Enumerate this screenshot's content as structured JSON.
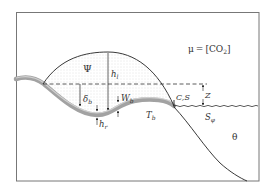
{
  "diagram": {
    "type": "ice-sheet / subglacial lake cross-section schematic",
    "equation": {
      "lhs": "μ",
      "eq": "=",
      "rhs_open": "[CO",
      "rhs_sub": "2",
      "rhs_close": "]"
    },
    "labels": {
      "psi": "Ψ",
      "hl": "h",
      "hl_sub": "l",
      "delta_b": "δ",
      "delta_b_sub": "b",
      "wb": "W",
      "wb_sub": "b",
      "hr": "h",
      "hr_sub": "r",
      "tb": "T",
      "tb_sub": "b",
      "cs": "C,S",
      "z": "Z",
      "s_phi": "S",
      "s_phi_sub": "φ",
      "theta": "θ"
    },
    "colors": {
      "frame": "#777777",
      "line": "#222222",
      "band": "#9a9a9a",
      "band_light": "#c8c8c8",
      "stipple": "#bdbdbd",
      "background": "#ffffff"
    }
  }
}
